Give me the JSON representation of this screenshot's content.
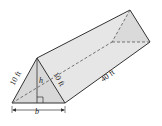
{
  "diagram": {
    "type": "triangular-prism",
    "labels": {
      "left_side": "10 ft",
      "right_side": "10 ft",
      "height": "h",
      "base": "b",
      "length": "40 ft"
    },
    "colors": {
      "face_fill": "#e8e8e8",
      "end_fill": "#d6d6d6",
      "stroke": "#333333",
      "hidden": "#555555"
    }
  }
}
